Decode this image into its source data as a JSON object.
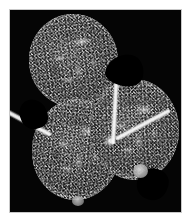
{
  "figure": {
    "caption": "",
    "background_color": "#ffffff",
    "field_color": "#000000",
    "frame_line_color": "#c9c9c9",
    "specimen_tone_light": "#e8e8e8",
    "specimen_tone_mid": "#7a7a7a",
    "specimen_tone_dark": "#3a3a3a",
    "alt_text": "Grayscale micrograph of a multilobed specimen on a black background",
    "width_px": 190,
    "height_px": 223
  },
  "plate": {
    "field_label": "black imaging field",
    "margin_label": "white plate margin"
  },
  "specimen": {
    "label": "multilobed specimen",
    "lobes": [
      {
        "id": "upper-left",
        "label": "upper left lobe"
      },
      {
        "id": "lower-left",
        "label": "lower left lobe"
      },
      {
        "id": "right",
        "label": "right lobe"
      }
    ],
    "septa": [
      {
        "id": "vertical",
        "label": "central vertical septum"
      },
      {
        "id": "left-arm",
        "label": "lower left septum arm"
      },
      {
        "id": "right-arm",
        "label": "lower right septum arm"
      },
      {
        "id": "hub",
        "label": "septum junction"
      }
    ],
    "notches": [
      {
        "id": "upper-right",
        "label": "notch between upper and right lobes"
      },
      {
        "id": "left",
        "label": "notch on left margin"
      },
      {
        "id": "bottom-right",
        "label": "notch on lower right margin"
      }
    ],
    "buds": [
      {
        "id": "lower-right",
        "label": "small bud on lower right margin"
      },
      {
        "id": "bottom",
        "label": "small bud on bottom margin"
      }
    ]
  }
}
